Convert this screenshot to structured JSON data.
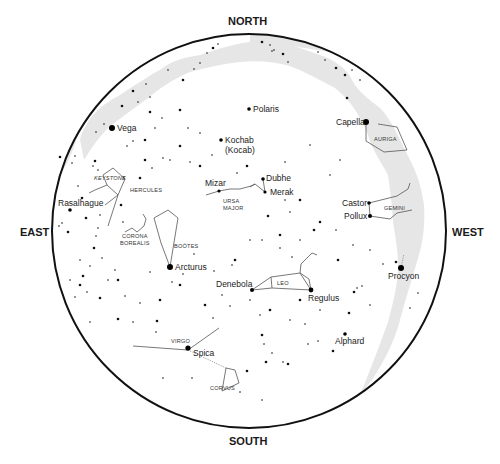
{
  "chart": {
    "title": "",
    "type": "sky-map",
    "horizon": {
      "cx": 249,
      "cy": 231,
      "r": 197,
      "stroke": "#111111"
    },
    "milky_way_color": "#e6e6e6",
    "compass": {
      "north": "NORTH",
      "south": "SOUTH",
      "east": "EAST",
      "west": "WEST"
    },
    "named_stars": [
      {
        "name": "Polaris",
        "x": 249,
        "y": 109,
        "size": 1.8,
        "label_dx": 4,
        "label_dy": 3
      },
      {
        "name": "Vega",
        "x": 112,
        "y": 128,
        "size": 3.0,
        "label_dx": 5,
        "label_dy": 3
      },
      {
        "name": "Kochab",
        "x": 221,
        "y": 140,
        "size": 1.8,
        "label_dx": 4,
        "label_dy": 3
      },
      {
        "name": "Capella",
        "x": 366,
        "y": 122,
        "size": 3.0,
        "label_dx": -30,
        "label_dy": 3
      },
      {
        "name": "Dubhe",
        "x": 263,
        "y": 179,
        "size": 1.8,
        "label_dx": 3,
        "label_dy": 2
      },
      {
        "name": "Merak",
        "x": 265,
        "y": 192,
        "size": 1.6,
        "label_dx": 5,
        "label_dy": 3
      },
      {
        "name": "Mizar",
        "x": 219,
        "y": 191,
        "size": 1.6,
        "label_dx": -14,
        "label_dy": -5
      },
      {
        "name": "Rasalhague",
        "x": 70,
        "y": 210,
        "size": 1.8,
        "label_dx": -12,
        "label_dy": -4
      },
      {
        "name": "Castor",
        "x": 369,
        "y": 203,
        "size": 1.8,
        "label_dx": -27,
        "label_dy": 3
      },
      {
        "name": "Pollux",
        "x": 370,
        "y": 216,
        "size": 2.0,
        "label_dx": -26,
        "label_dy": 3
      },
      {
        "name": "Arcturus",
        "x": 170,
        "y": 267,
        "size": 3.0,
        "label_dx": 5,
        "label_dy": 3
      },
      {
        "name": "Procyon",
        "x": 401,
        "y": 268,
        "size": 3.0,
        "label_dx": -13,
        "label_dy": 11
      },
      {
        "name": "Denebola",
        "x": 252,
        "y": 290,
        "size": 2.0,
        "label_dx": -36,
        "label_dy": -3
      },
      {
        "name": "Regulus",
        "x": 311,
        "y": 290,
        "size": 2.4,
        "label_dx": -3,
        "label_dy": 11
      },
      {
        "name": "Alphard",
        "x": 345,
        "y": 334,
        "size": 1.8,
        "label_dx": -10,
        "label_dy": 10
      },
      {
        "name": "Spica",
        "x": 188,
        "y": 348,
        "size": 2.6,
        "label_dx": 5,
        "label_dy": 8
      }
    ],
    "extra_labels": [
      {
        "text": "(Kocab)",
        "x": 225,
        "y": 153,
        "kind": "star"
      }
    ],
    "constellations": [
      {
        "name": "HERCULES",
        "x": 130,
        "y": 192
      },
      {
        "name": "KEYSTONE",
        "x": 94,
        "y": 180,
        "italic": true
      },
      {
        "name": "CORONA",
        "x": 122,
        "y": 238
      },
      {
        "name": "BOREALIS",
        "x": 120,
        "y": 245
      },
      {
        "name": "BOÖTES",
        "x": 174,
        "y": 248
      },
      {
        "name": "URSA",
        "x": 223,
        "y": 203
      },
      {
        "name": "MAJOR",
        "x": 223,
        "y": 210
      },
      {
        "name": "AURIGA",
        "x": 374,
        "y": 141
      },
      {
        "name": "GEMINI",
        "x": 384,
        "y": 210
      },
      {
        "name": "LEO",
        "x": 277,
        "y": 285
      },
      {
        "name": "VIRGO",
        "x": 171,
        "y": 343
      },
      {
        "name": "CORVUS",
        "x": 210,
        "y": 390
      }
    ],
    "lines": [
      [
        [
          366,
          122
        ],
        [
          366,
          141
        ],
        [
          384,
          152
        ],
        [
          407,
          150
        ],
        [
          397,
          127
        ],
        [
          378,
          124
        ]
      ],
      [
        [
          369,
          203
        ],
        [
          397,
          196
        ],
        [
          408,
          189
        ],
        [
          410,
          183
        ]
      ],
      [
        [
          370,
          216
        ],
        [
          390,
          219
        ],
        [
          397,
          213
        ],
        [
          412,
          210
        ]
      ],
      [
        [
          369,
          203
        ],
        [
          370,
          216
        ]
      ],
      [
        [
          219,
          191
        ],
        [
          230,
          189
        ],
        [
          240,
          189
        ],
        [
          251,
          186
        ],
        [
          255,
          184
        ],
        [
          265,
          192
        ],
        [
          263,
          179
        ]
      ],
      [
        [
          219,
          191
        ],
        [
          206,
          195
        ]
      ],
      [
        [
          255,
          184
        ],
        [
          250,
          187
        ]
      ],
      [
        [
          170,
          267
        ],
        [
          161,
          243
        ],
        [
          154,
          218
        ],
        [
          168,
          210
        ],
        [
          178,
          218
        ],
        [
          170,
          267
        ]
      ],
      [
        [
          118,
          195
        ],
        [
          107,
          185
        ],
        [
          103,
          175
        ],
        [
          113,
          168
        ],
        [
          125,
          179
        ],
        [
          118,
          195
        ],
        [
          105,
          205
        ]
      ],
      [
        [
          107,
          185
        ],
        [
          95,
          190
        ],
        [
          89,
          193
        ]
      ],
      [
        [
          118,
          195
        ],
        [
          108,
          226
        ]
      ],
      [
        [
          125,
          232
        ],
        [
          132,
          228
        ],
        [
          137,
          232
        ],
        [
          144,
          226
        ],
        [
          146,
          219
        ],
        [
          143,
          214
        ]
      ],
      [
        [
          252,
          290
        ],
        [
          271,
          277
        ],
        [
          300,
          273
        ],
        [
          311,
          290
        ]
      ],
      [
        [
          252,
          290
        ],
        [
          272,
          288
        ],
        [
          311,
          290
        ]
      ],
      [
        [
          271,
          277
        ],
        [
          272,
          288
        ]
      ],
      [
        [
          300,
          273
        ],
        [
          301,
          264
        ],
        [
          312,
          253
        ],
        [
          317,
          255
        ]
      ],
      [
        [
          300,
          273
        ],
        [
          309,
          279
        ],
        [
          311,
          290
        ]
      ],
      [
        [
          133,
          346
        ],
        [
          188,
          350
        ]
      ],
      [
        [
          188,
          350
        ],
        [
          219,
          328
        ]
      ],
      [
        [
          222,
          391
        ],
        [
          226,
          368
        ],
        [
          235,
          370
        ],
        [
          239,
          383
        ],
        [
          222,
          391
        ]
      ]
    ],
    "dashed_lines": [
      [
        [
          188,
          350
        ],
        [
          226,
          368
        ]
      ],
      [
        [
          401,
          268
        ],
        [
          404,
          254
        ]
      ]
    ]
  }
}
